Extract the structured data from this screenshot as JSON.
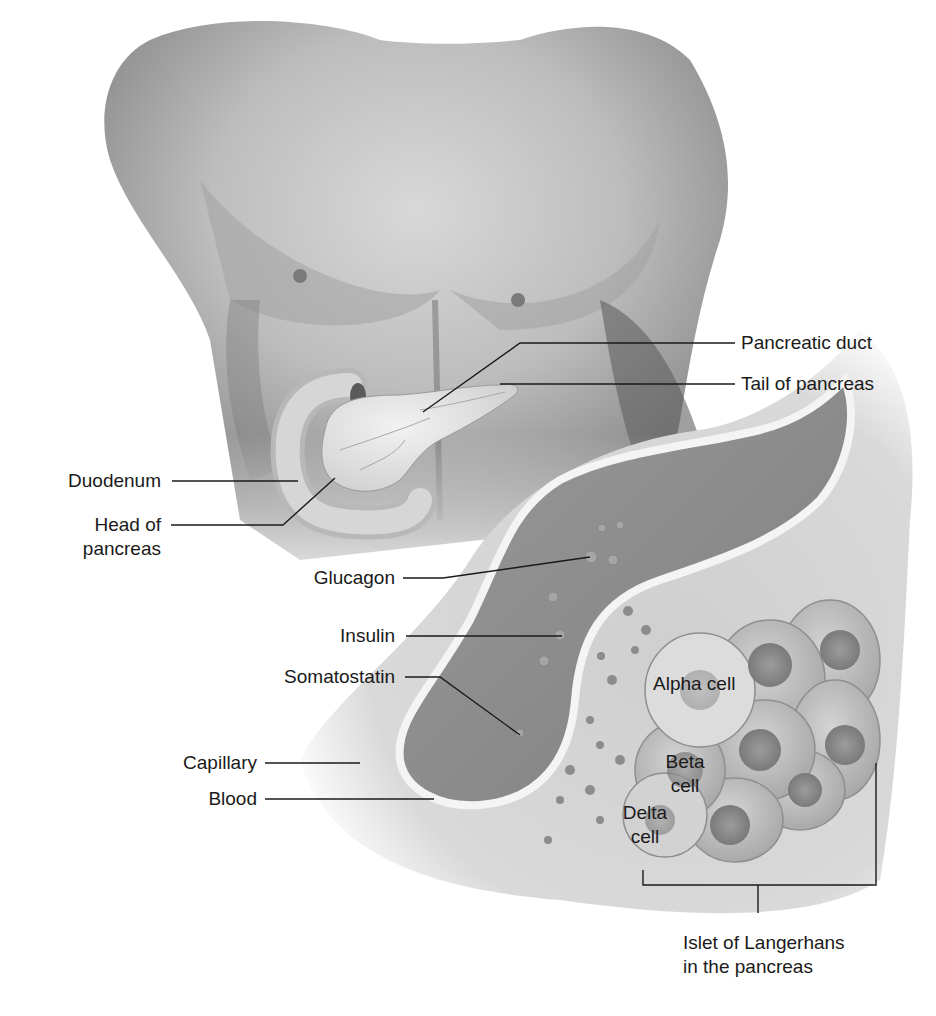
{
  "diagram": {
    "colors": {
      "background": "#ffffff",
      "skin_light": "#e6e6e6",
      "skin_shadow": "#6a6a6a",
      "blood": "#8a8a8a",
      "capillary_wall": "#f2f2f2",
      "cell_fill": "#bdbdbd",
      "nucleus": "#8f8f8f",
      "label_text": "#1a1a1a",
      "leader_line": "#1a1a1a"
    },
    "labels": {
      "pancreatic_duct": "Pancreatic duct",
      "tail_of_pancreas": "Tail of pancreas",
      "duodenum": "Duodenum",
      "head_of_pancreas_line1": "Head of",
      "head_of_pancreas_line2": "pancreas",
      "glucagon": "Glucagon",
      "insulin": "Insulin",
      "somatostatin": "Somatostatin",
      "capillary": "Capillary",
      "blood": "Blood",
      "alpha_cell": "Alpha cell",
      "beta_cell_line1": "Beta",
      "beta_cell_line2": "cell",
      "delta_cell_line1": "Delta",
      "delta_cell_line2": "cell",
      "islet_line1": "Islet of Langerhans",
      "islet_line2": "in the pancreas"
    }
  }
}
